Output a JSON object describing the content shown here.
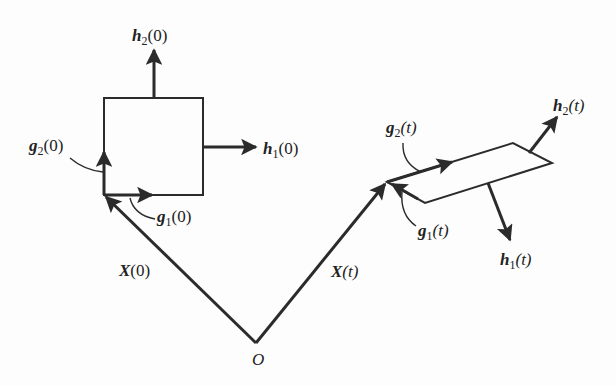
{
  "diagram": {
    "colors": {
      "stroke": "#2b2b2b",
      "background": "#fdfdfd"
    },
    "origin": {
      "label": "O"
    },
    "reference": {
      "position_label": {
        "sym": "X",
        "arg": "(0)"
      },
      "g1": {
        "sym": "g",
        "sub": "1",
        "arg": "(0)"
      },
      "g2": {
        "sym": "g",
        "sub": "2",
        "arg": "(0)"
      },
      "h1": {
        "sym": "h",
        "sub": "1",
        "arg": "(0)"
      },
      "h2": {
        "sym": "h",
        "sub": "2",
        "arg": "(0)"
      }
    },
    "current": {
      "position_label": {
        "sym": "X",
        "arg": "(t)"
      },
      "g1": {
        "sym": "g",
        "sub": "1",
        "arg": "(t)"
      },
      "g2": {
        "sym": "g",
        "sub": "2",
        "arg": "(t)"
      },
      "h1": {
        "sym": "h",
        "sub": "1",
        "arg": "(t)"
      },
      "h2": {
        "sym": "h",
        "sub": "2",
        "arg": "(t)"
      }
    }
  }
}
